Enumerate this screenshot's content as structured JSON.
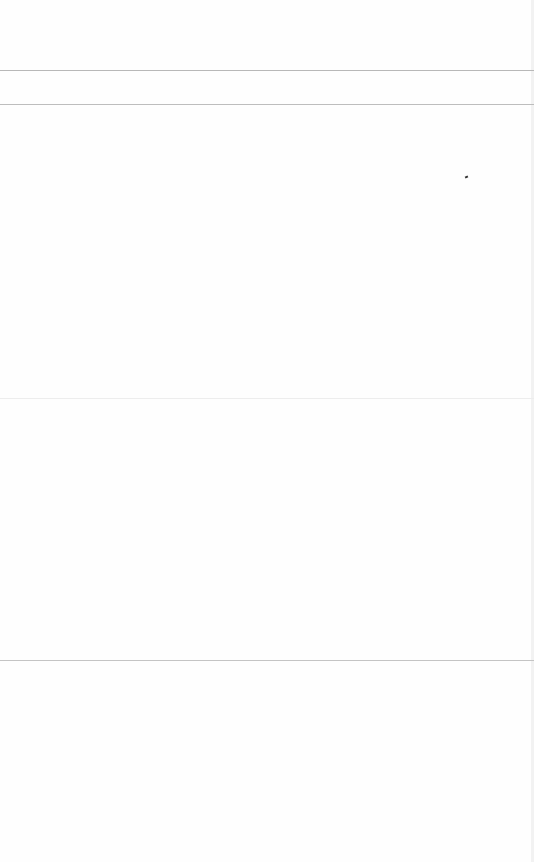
{
  "page": {
    "rules": [
      {
        "y": 70,
        "color": "#b8b8b8"
      },
      {
        "y": 104,
        "color": "#bdbdbd"
      },
      {
        "y": 398,
        "color": "#ededed"
      },
      {
        "y": 660,
        "color": "#c4c4c4"
      }
    ],
    "marks": [
      {
        "x": 466,
        "y": 177
      }
    ]
  }
}
